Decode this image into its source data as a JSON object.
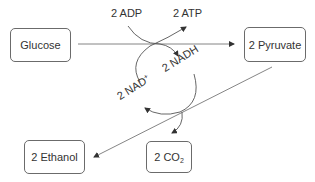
{
  "diagram": {
    "title": "",
    "nodes": {
      "glucose": {
        "label": "Glucose"
      },
      "pyruvate": {
        "label": "2 Pyruvate"
      },
      "ethanol": {
        "label": "2 Ethanol"
      },
      "co2": {
        "label_main": "2 CO",
        "label_sub": "2"
      }
    },
    "cofactors": {
      "adp": {
        "label": "2 ADP"
      },
      "atp": {
        "label": "2 ATP"
      },
      "nadh": {
        "label": "2 NADH"
      },
      "nad": {
        "label_main": "2 NAD",
        "label_sup": "+"
      }
    },
    "edges": [
      {
        "from": "Glucose",
        "to": "2 Pyruvate",
        "side_in": "2 ADP",
        "side_out": "2 ATP",
        "byproduct": "2 NADH"
      },
      {
        "from": "2 Pyruvate",
        "to": "2 Ethanol",
        "side_in": "2 NADH",
        "side_out": "2 NAD+",
        "byproduct": "2 CO2"
      }
    ],
    "colors": {
      "line": "#6b6b6b",
      "text": "#333333",
      "background": "#ffffff"
    }
  }
}
